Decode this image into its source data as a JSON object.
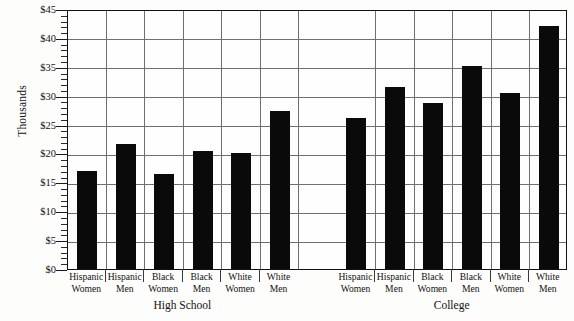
{
  "chart_data": {
    "type": "bar",
    "title": "",
    "xlabel": "",
    "ylabel": "Thousands",
    "ylim": [
      0,
      45
    ],
    "ytick_step": 5,
    "yminor_step": 1,
    "grid": true,
    "legend": "none",
    "bar_color": "#0a0a0a",
    "grid_color": "#6f6f6f",
    "axis_color": "#111111",
    "ytick_labels": [
      "$0",
      "$5",
      "$10",
      "$15",
      "$20",
      "$25",
      "$30",
      "$35",
      "$40",
      "$45"
    ],
    "ytick_values": [
      0,
      5,
      10,
      15,
      20,
      25,
      30,
      35,
      40,
      45
    ],
    "groups": [
      {
        "name": "High School",
        "categories": [
          "Hispanic Women",
          "Hispanic Men",
          "Black Women",
          "Black Men",
          "White Women",
          "White Men"
        ],
        "category_lines": [
          [
            "Hispanic",
            "Women"
          ],
          [
            "Hispanic",
            "Men"
          ],
          [
            "Black",
            "Women"
          ],
          [
            "Black",
            "Men"
          ],
          [
            "White",
            "Women"
          ],
          [
            "White",
            "Men"
          ]
        ],
        "values": [
          17.0,
          21.7,
          16.5,
          20.5,
          20.0,
          27.3
        ]
      },
      {
        "name": "College",
        "categories": [
          "Hispanic Women",
          "Hispanic Men",
          "Black Women",
          "Black Men",
          "White Women",
          "White Men"
        ],
        "category_lines": [
          [
            "Hispanic",
            "Women"
          ],
          [
            "Hispanic",
            "Men"
          ],
          [
            "Black",
            "Women"
          ],
          [
            "Black",
            "Men"
          ],
          [
            "White",
            "Women"
          ],
          [
            "White",
            "Men"
          ]
        ],
        "values": [
          26.2,
          31.5,
          28.8,
          35.2,
          30.5,
          42.0
        ]
      }
    ]
  }
}
